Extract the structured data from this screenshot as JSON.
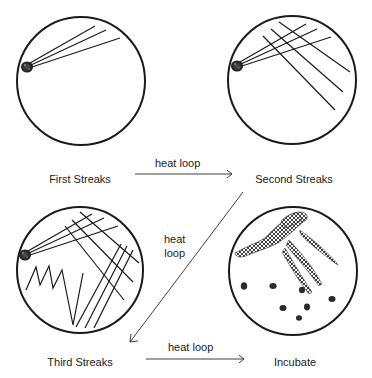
{
  "diagram": {
    "colors": {
      "stroke": "#1a1a1a",
      "colony": "#2a2a2a",
      "background": "#ffffff",
      "text": "#222222"
    },
    "plates": [
      {
        "id": "first",
        "label": "First Streaks"
      },
      {
        "id": "second",
        "label": "Second Streaks"
      },
      {
        "id": "third",
        "label": "Third Streaks"
      },
      {
        "id": "incubate",
        "label": "Incubate"
      }
    ],
    "arrows": [
      {
        "from": "first",
        "to": "second",
        "label": "heat loop"
      },
      {
        "from": "second",
        "to": "third",
        "label_line1": "heat",
        "label_line2": "loop"
      },
      {
        "from": "third",
        "to": "incubate",
        "label": "heat loop"
      }
    ]
  }
}
